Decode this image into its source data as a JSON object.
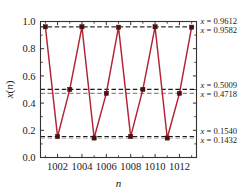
{
  "chart_data": {
    "type": "line",
    "title": "",
    "xlabel": "n",
    "ylabel": "x(n)",
    "xlim": [
      1000.6,
      1013.4
    ],
    "ylim": [
      0.0,
      1.0
    ],
    "grid": false,
    "legend": "none",
    "x": [
      1001,
      1002,
      1003,
      1004,
      1005,
      1006,
      1007,
      1008,
      1009,
      1010,
      1011,
      1012,
      1013
    ],
    "values": [
      0.9612,
      0.154,
      0.5009,
      0.9612,
      0.1432,
      0.4718,
      0.9582,
      0.154,
      0.5009,
      0.9612,
      0.1432,
      0.4718,
      0.9582
    ],
    "series": [
      {
        "name": "x(n)",
        "color": "#B22234",
        "marker": "square",
        "marker_color": "#4a1010",
        "values": [
          0.9612,
          0.154,
          0.5009,
          0.9612,
          0.1432,
          0.4718,
          0.9582,
          0.154,
          0.5009,
          0.9612,
          0.1432,
          0.4718,
          0.9582
        ]
      }
    ],
    "yticks": [
      "0.0",
      "0.2",
      "0.4",
      "0.6",
      "0.8",
      "1.0"
    ],
    "ytick_values": [
      0.0,
      0.2,
      0.4,
      0.6,
      0.8,
      1.0
    ],
    "xticks": [
      "1002",
      "1004",
      "1006",
      "1008",
      "1010",
      "1012"
    ],
    "xtick_values": [
      1002,
      1004,
      1006,
      1008,
      1010,
      1012
    ],
    "reference_lines": [
      {
        "value": 0.9612,
        "label": "x = 0.9612",
        "style": "dashed",
        "color": "#1a1a1a"
      },
      {
        "value": 0.9582,
        "label": "x = 0.9582",
        "style": "dashed",
        "color": "#8c8c8c"
      },
      {
        "value": 0.5009,
        "label": "x = 0.5009",
        "style": "dashed",
        "color": "#1a1a1a"
      },
      {
        "value": 0.4718,
        "label": "x = 0.4718",
        "style": "dashed",
        "color": "#8c8c8c"
      },
      {
        "value": 0.154,
        "label": "x = 0.1540",
        "style": "dashed",
        "color": "#1a1a1a"
      },
      {
        "value": 0.1432,
        "label": "x = 0.1432",
        "style": "dashed",
        "color": "#8c8c8c"
      }
    ],
    "annotations": [
      {
        "text": "x = 0.9612",
        "value": 0.9612
      },
      {
        "text": "x = 0.9582",
        "value": 0.9582
      },
      {
        "text": "x = 0.5009",
        "value": 0.5009
      },
      {
        "text": "x = 0.4718",
        "value": 0.4718
      },
      {
        "text": "x = 0.1540",
        "value": 0.154
      },
      {
        "text": "x = 0.1432",
        "value": 0.1432
      }
    ]
  },
  "axis": {
    "ylabel_var": "x",
    "ylabel_paren_open": "(",
    "ylabel_n": "n",
    "ylabel_paren_close": ")",
    "xlabel": "n"
  },
  "ref_label_parts": {
    "var": "x",
    "eq": " = "
  }
}
